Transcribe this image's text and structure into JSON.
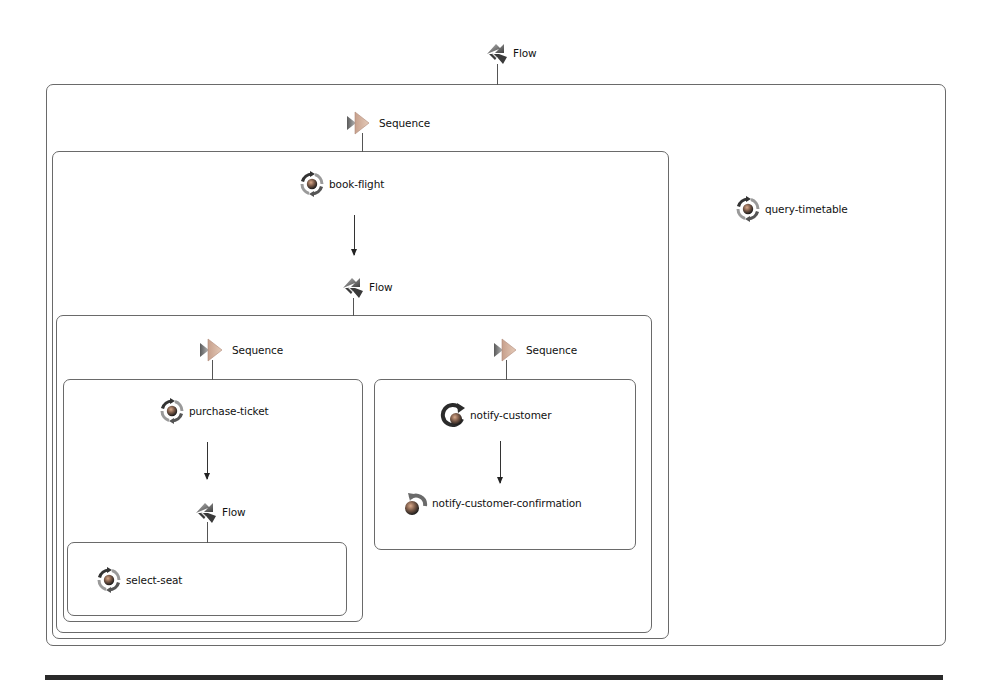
{
  "diagram": {
    "type": "BPEL process tree",
    "root": {
      "kind": "Flow",
      "label": "Flow",
      "icon": "flow-icon"
    },
    "nodes": {
      "root_flow": {
        "label": "Flow",
        "icon": "flow-icon"
      },
      "outer_sequence": {
        "label": "Sequence",
        "icon": "sequence-icon"
      },
      "book_flight": {
        "label": "book-flight",
        "icon": "invoke-icon"
      },
      "mid_flow": {
        "label": "Flow",
        "icon": "flow-icon"
      },
      "left_sequence": {
        "label": "Sequence",
        "icon": "sequence-icon"
      },
      "purchase_ticket": {
        "label": "purchase-ticket",
        "icon": "invoke-icon"
      },
      "inner_flow": {
        "label": "Flow",
        "icon": "flow-icon"
      },
      "select_seat": {
        "label": "select-seat",
        "icon": "invoke-icon"
      },
      "right_sequence": {
        "label": "Sequence",
        "icon": "sequence-icon"
      },
      "notify_customer": {
        "label": "notify-customer",
        "icon": "reply-icon"
      },
      "notify_customer_confirmation": {
        "label": "notify-customer-confirmation",
        "icon": "receive-icon"
      },
      "query_timetable": {
        "label": "query-timetable",
        "icon": "invoke-icon"
      }
    },
    "edges": [
      [
        "book-flight",
        "Flow"
      ],
      [
        "purchase-ticket",
        "Flow"
      ],
      [
        "notify-customer",
        "notify-customer-confirmation"
      ]
    ],
    "colors": {
      "frame": "#6a6a6a",
      "text": "#111111",
      "icon_dark": "#2b2b2b",
      "icon_gray": "#8a8a8a",
      "sequence_orange": "#c98a6a"
    }
  }
}
